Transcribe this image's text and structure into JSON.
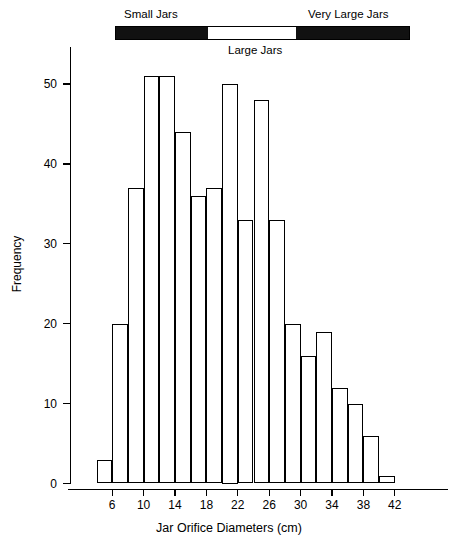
{
  "chart_data": {
    "type": "bar",
    "title": "",
    "subtitle": "",
    "xlabel": "Jar Orifice Diameters (cm)",
    "ylabel": "Frequency",
    "xlim": [
      4,
      44
    ],
    "ylim": [
      0,
      53
    ],
    "grid": false,
    "legend_position": "top",
    "bin_width": 2,
    "bin_starts": [
      4,
      6,
      8,
      10,
      12,
      14,
      16,
      18,
      20,
      22,
      24,
      26,
      28,
      30,
      32,
      34,
      36,
      38,
      40
    ],
    "categories": [
      "4-6",
      "6-8",
      "8-10",
      "10-12",
      "12-14",
      "14-16",
      "16-18",
      "18-20",
      "20-22",
      "22-24",
      "24-26",
      "26-28",
      "28-30",
      "30-32",
      "32-34",
      "34-36",
      "36-38",
      "38-40",
      "40-42"
    ],
    "values": [
      3,
      20,
      37,
      51,
      51,
      44,
      36,
      37,
      50,
      33,
      48,
      33,
      20,
      16,
      19,
      12,
      10,
      6,
      1
    ],
    "x_tick_values": [
      6,
      10,
      14,
      18,
      22,
      26,
      30,
      34,
      38,
      42
    ],
    "x_tick_labels": [
      "6",
      "10",
      "14",
      "18",
      "22",
      "26",
      "30",
      "34",
      "38",
      "42"
    ],
    "y_tick_values": [
      0,
      10,
      20,
      30,
      40,
      50
    ],
    "y_tick_labels": [
      "0",
      "10",
      "20",
      "30",
      "40",
      "50"
    ],
    "annotations": [
      {
        "name": "small-jars",
        "label": "Small Jars",
        "fill": "dark",
        "start": 4,
        "end": 16.5
      },
      {
        "name": "large-jars",
        "label": "Large Jars",
        "fill": "light",
        "start": 16.5,
        "end": 28.6
      },
      {
        "name": "very-large-jars",
        "label": "Very Large Jars",
        "fill": "dark",
        "start": 28.6,
        "end": 44
      }
    ],
    "colors": {
      "bar_fill": "#ffffff",
      "bar_edge": "#000000",
      "annotation_dark": "#111111",
      "annotation_light": "#ffffff",
      "axis": "#000000",
      "background": "#ffffff"
    }
  }
}
